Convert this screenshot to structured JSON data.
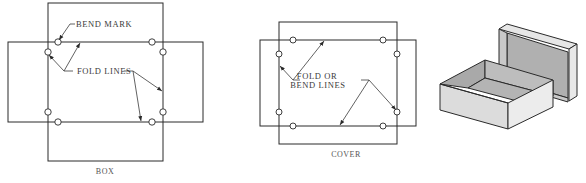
{
  "box_diagram": {
    "caption": "BOX",
    "labels": {
      "bend_mark": "BEND MARK",
      "fold_lines": "FOLD LINES"
    }
  },
  "cover_diagram": {
    "caption": "COVER",
    "labels": {
      "fold_or": "FOLD OR",
      "bend_lines": "BEND LINES"
    }
  },
  "isometric_box": {
    "description": "Open box with lid",
    "colors": {
      "light_face": "#e4e4e4",
      "mid_face": "#c8c8c8",
      "dark_face": "#a9a9a9",
      "edge": "#2a2a2a"
    }
  }
}
